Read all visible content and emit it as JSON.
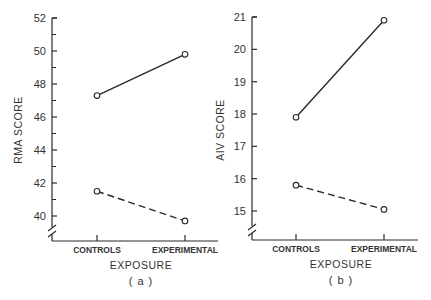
{
  "chart_data": [
    {
      "type": "line",
      "panel_label": "(a)",
      "title": "",
      "xlabel": "EXPOSURE",
      "ylabel": "RMA SCORE",
      "categories": [
        "CONTROLS",
        "EXPERIMENTAL"
      ],
      "yticks": [
        40,
        42,
        44,
        46,
        48,
        50,
        52
      ],
      "ylim": [
        39,
        52
      ],
      "axis_break": true,
      "grid": false,
      "legend": null,
      "series": [
        {
          "name": "solid",
          "style": "solid",
          "values": [
            47.3,
            49.8
          ]
        },
        {
          "name": "dashed",
          "style": "dashed",
          "values": [
            41.5,
            39.7
          ]
        }
      ]
    },
    {
      "type": "line",
      "panel_label": "(b)",
      "title": "",
      "xlabel": "EXPOSURE",
      "ylabel": "AIV SCORE",
      "categories": [
        "CONTROLS",
        "EXPERIMENTAL"
      ],
      "yticks": [
        15,
        16,
        17,
        18,
        19,
        20,
        21
      ],
      "ylim": [
        14.1,
        21
      ],
      "axis_break": true,
      "grid": false,
      "legend": null,
      "series": [
        {
          "name": "solid",
          "style": "solid",
          "values": [
            17.9,
            20.9
          ]
        },
        {
          "name": "dashed",
          "style": "dashed",
          "values": [
            15.8,
            15.05
          ]
        }
      ]
    }
  ],
  "colors": {
    "ink": "#2a2a2a",
    "background": "#ffffff"
  }
}
